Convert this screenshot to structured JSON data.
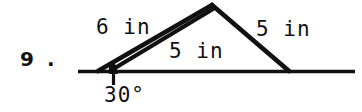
{
  "problem": {
    "number_label": "9 ."
  },
  "figure": {
    "labels": {
      "left_outer_side": "6 in",
      "left_inner_side": "5 in",
      "right_side": "5 in",
      "angle": "30°"
    },
    "colors": {
      "ink": "#111111",
      "background": "#ffffff"
    },
    "geometry": {
      "baseline": {
        "x1": 78,
        "y1": 71.5,
        "x2": 355,
        "y2": 71.5
      },
      "left_vertex": {
        "x": 98,
        "y": 71
      },
      "apex": {
        "x": 212,
        "y": 5
      },
      "right_foot": {
        "x": 289,
        "y": 71
      },
      "inner_start": {
        "x": 110,
        "y": 71
      },
      "angle_pointer": {
        "x": 114,
        "y": 86,
        "tip_y": 67
      }
    }
  }
}
